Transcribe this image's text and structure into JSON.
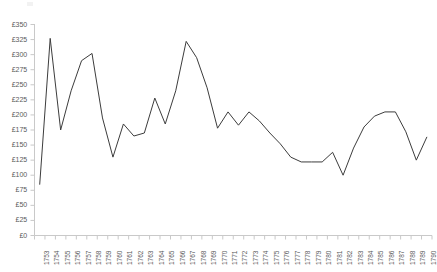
{
  "chart_data": {
    "type": "line",
    "title": "",
    "subtitle": "",
    "xlabel": "",
    "ylabel": "",
    "ylim": [
      0,
      350
    ],
    "grid": false,
    "legend": null,
    "currency_symbol": "£",
    "y_ticks": [
      0,
      25,
      50,
      75,
      100,
      125,
      150,
      175,
      200,
      225,
      250,
      275,
      300,
      325,
      350
    ],
    "y_tick_labels": [
      "£0",
      "£25",
      "£50",
      "£75",
      "£100",
      "£125",
      "£150",
      "£175",
      "£200",
      "£225",
      "£250",
      "£275",
      "£300",
      "£325",
      "£350"
    ],
    "categories": [
      "1753",
      "1754",
      "1755",
      "1756",
      "1757",
      "1758",
      "1759",
      "1760",
      "1761",
      "1762",
      "1763",
      "1764",
      "1765",
      "1766",
      "1767",
      "1768",
      "1769",
      "1770",
      "1771",
      "1772",
      "1773",
      "1774",
      "1775",
      "1776",
      "1777",
      "1778",
      "1779",
      "1780",
      "1781",
      "1782",
      "1783",
      "1784",
      "1785",
      "1786",
      "1787",
      "1788",
      "1789",
      "1790"
    ],
    "series": [
      {
        "name": "Price",
        "color": "#3c3c3c",
        "values": [
          85,
          327,
          175,
          240,
          290,
          302,
          195,
          130,
          185,
          165,
          170,
          228,
          185,
          240,
          322,
          295,
          245,
          178,
          205,
          183,
          205,
          190,
          170,
          152,
          130,
          122,
          122,
          122,
          138,
          100,
          145,
          180,
          198,
          205,
          205,
          172,
          125,
          163
        ]
      }
    ]
  },
  "axis": {
    "x_axis_name": "year-axis",
    "y_axis_name": "price-axis"
  }
}
